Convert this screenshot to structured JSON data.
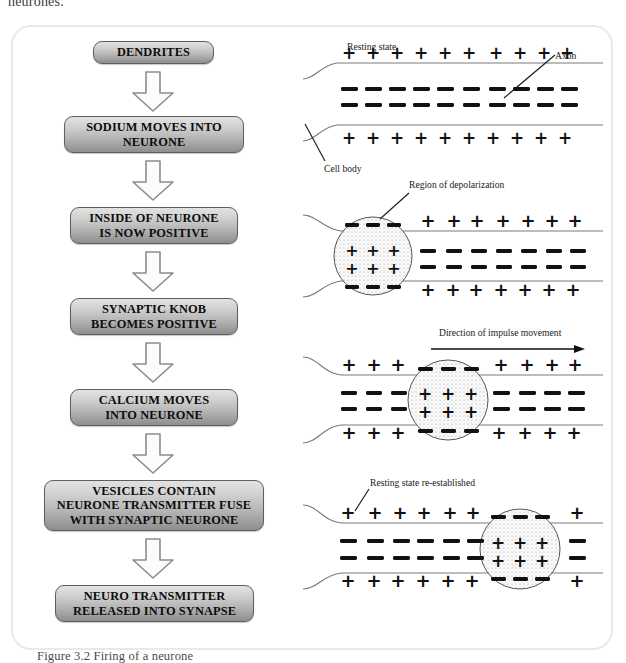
{
  "page": {
    "running_text": "neurones.",
    "caption": "Figure 3.2 Firing of a neurone"
  },
  "flowchart": {
    "steps": [
      {
        "id": "dendrites",
        "label": "DENDRITES"
      },
      {
        "id": "sodium-moves-into",
        "label": "SODIUM MOVES INTO\nNEURONE"
      },
      {
        "id": "inside-positive",
        "label": "INSIDE OF NEURONE\nIS NOW POSITIVE"
      },
      {
        "id": "synaptic-knob",
        "label": "SYNAPTIC KNOB\nBECOMES POSITIVE"
      },
      {
        "id": "calcium-moves-into",
        "label": "CALCIUM MOVES\nINTO NEURONE"
      },
      {
        "id": "vesicles-fuse",
        "label": "VESICLES CONTAIN\nNEURONE TRANSMITTER FUSE\nWITH SYNAPTIC NEURONE"
      },
      {
        "id": "transmitter-released",
        "label": "NEURO TRANSMITTER\nRELEASED INTO SYNAPSE"
      }
    ],
    "arrow_count": 6,
    "arrow_icon": "arrow-down-icon",
    "box_fill_top": "#e2e2e2",
    "box_fill_bottom": "#8e8e8e",
    "box_border": "#5e5e5e"
  },
  "diagrams": {
    "panels": [
      {
        "id": "resting-state",
        "labels": [
          {
            "name": "resting-state-label",
            "text": "Resting state"
          },
          {
            "name": "axon-label",
            "text": "Axon"
          },
          {
            "name": "cell-body-label",
            "text": "Cell body"
          }
        ],
        "outer_top_charges": "+ + + + + + + + + +",
        "inner_upper_charges": "- - - - - - - - - -",
        "inner_lower_charges": "- - - - - - - - - -",
        "outer_bottom_charges": "+ + + + + + + + + +",
        "depolarized_region": null
      },
      {
        "id": "depolarization-start",
        "labels": [
          {
            "name": "region-of-depolarization-label",
            "text": "Region of depolarization"
          }
        ],
        "outer_top_charges": "+ + + + + + +",
        "inner_upper_charges": "- - - - - - -",
        "inner_lower_charges": "- - - - - - -",
        "outer_bottom_charges": "+ + + + + + +",
        "depolarized_region": {
          "position": "cell-body",
          "inner_charge": "+",
          "outer_charge": "-"
        }
      },
      {
        "id": "impulse-travelling",
        "labels": [
          {
            "name": "direction-of-impulse-label",
            "text": "Direction of impulse movement"
          }
        ],
        "outer_top_charges": "+ + +   + + + +",
        "inner_upper_charges": "- - -   - - - -",
        "inner_lower_charges": "- - -   - - - -",
        "outer_bottom_charges": "+ + +   + + + +",
        "depolarized_region": {
          "position": "mid-axon",
          "inner_charge": "+",
          "outer_charge": "-"
        }
      },
      {
        "id": "resting-state-re-established",
        "labels": [
          {
            "name": "resting-state-re-established-label",
            "text": "Resting state re-established"
          }
        ],
        "outer_top_charges": "+ + + + + +   +",
        "inner_upper_charges": "- - - - - -   -",
        "inner_lower_charges": "- - - - - -   -",
        "outer_bottom_charges": "+ + + + + +   +",
        "depolarized_region": {
          "position": "distal-axon",
          "inner_charge": "+",
          "outer_charge": "-"
        }
      }
    ],
    "membrane_color": "#777777",
    "charge_color": "#111111"
  }
}
